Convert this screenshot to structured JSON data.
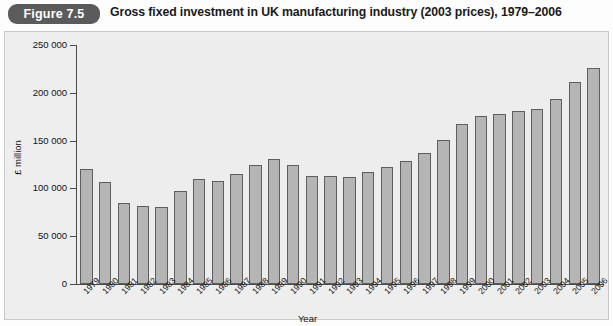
{
  "figure": {
    "badge_label": "Figure 7.5",
    "title": "Gross fixed investment in UK manufacturing industry (2003 prices), 1979–2006",
    "badge_color": "#5b5b5b",
    "bar_fill_color": "#b5b5b5",
    "bar_border_color": "#5e5e5e",
    "panel_background": "#eeeeee"
  },
  "chart_data": {
    "type": "bar",
    "title": "Gross fixed investment in UK manufacturing industry (2003 prices), 1979–2006",
    "xlabel": "Year",
    "ylabel": "£ million",
    "ylim": [
      0,
      250000
    ],
    "ytick_values": [
      0,
      50000,
      100000,
      150000,
      200000,
      250000
    ],
    "ytick_labels": [
      "0",
      "50 000",
      "100 000",
      "150 000",
      "200 000",
      "250 000"
    ],
    "grid": false,
    "legend": false,
    "categories": [
      "1979",
      "1980",
      "1981",
      "1982",
      "1983",
      "1984",
      "1985",
      "1986",
      "1987",
      "1988",
      "1989",
      "1990",
      "1991",
      "1992",
      "1993",
      "1994",
      "1995",
      "1996",
      "1997",
      "1998",
      "1999",
      "2000",
      "2001",
      "2002",
      "2003",
      "2004",
      "2005",
      "2006"
    ],
    "values": [
      120000,
      107000,
      85000,
      82000,
      81000,
      97000,
      110000,
      108000,
      115000,
      125000,
      131000,
      125000,
      113000,
      113000,
      112000,
      117000,
      122000,
      129000,
      137000,
      151000,
      167000,
      176000,
      178000,
      181000,
      183000,
      194000,
      211000,
      226000
    ]
  }
}
